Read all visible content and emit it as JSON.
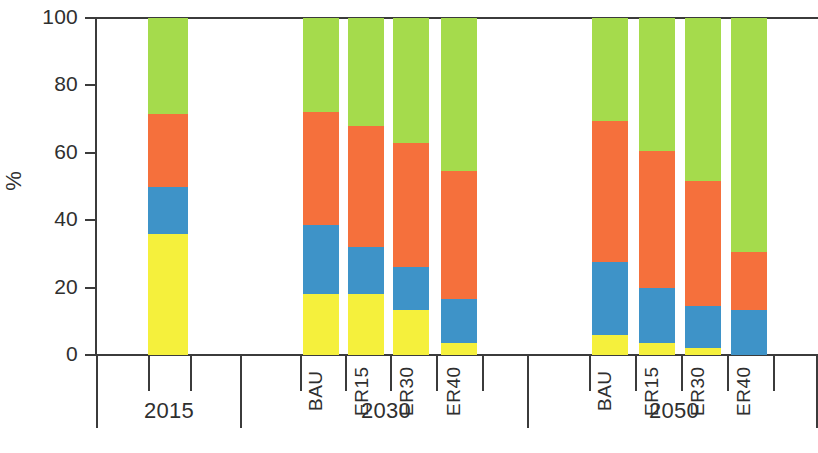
{
  "chart_data": {
    "type": "bar",
    "subtype": "stacked-100-percent",
    "title": "",
    "xlabel": "",
    "ylabel": "%",
    "ylim": [
      0,
      100
    ],
    "yticks": [
      0,
      20,
      40,
      60,
      80,
      100
    ],
    "ytick_labels": [
      "0",
      "20",
      "40",
      "60",
      "80",
      "100"
    ],
    "grid": false,
    "legend": "none",
    "colors": {
      "yellow": "#F5F03C",
      "blue": "#3E93C8",
      "orange": "#F5703C",
      "green": "#A5DB4C"
    },
    "series": [
      {
        "name": "yellow",
        "color": "#F5F03C",
        "values": [
          36,
          18,
          18,
          13.5,
          3.5,
          6,
          3.5,
          2,
          0
        ]
      },
      {
        "name": "blue",
        "color": "#3E93C8",
        "values": [
          14,
          20.5,
          14,
          12.5,
          13,
          21.5,
          16.5,
          12.5,
          13.5
        ]
      },
      {
        "name": "orange",
        "color": "#F5703C",
        "values": [
          21.5,
          33.5,
          36,
          37,
          38,
          42,
          40.5,
          37,
          17
        ]
      },
      {
        "name": "green",
        "color": "#A5DB4C",
        "values": [
          28.5,
          28,
          32,
          37,
          45.5,
          30.5,
          39.5,
          48.5,
          69.5
        ]
      }
    ],
    "categories": [
      "2015",
      "BAU",
      "ER15",
      "ER30",
      "ER40",
      "BAU",
      "ER15",
      "ER30",
      "ER40"
    ],
    "groups": [
      {
        "label": "2015",
        "scenarios": [
          "2015"
        ]
      },
      {
        "label": "2030",
        "scenarios": [
          "BAU",
          "ER15",
          "ER30",
          "ER40"
        ]
      },
      {
        "label": "2050",
        "scenarios": [
          "BAU",
          "ER15",
          "ER30",
          "ER40"
        ]
      }
    ]
  },
  "axis": {
    "y_title": "%",
    "y_ticks": [
      {
        "label": "100",
        "value": 100
      },
      {
        "label": "80",
        "value": 80
      },
      {
        "label": "60",
        "value": 60
      },
      {
        "label": "40",
        "value": 40
      },
      {
        "label": "20",
        "value": 20
      },
      {
        "label": "0",
        "value": 0
      }
    ]
  },
  "bars": [
    {
      "id": "bar-2015",
      "group": "2015",
      "scenario": "2015",
      "x": 148,
      "width": 40,
      "yellow": 36,
      "blue": 14,
      "orange": 21.5,
      "green": 28.5,
      "show_scenario_label": false
    },
    {
      "id": "bar-2030-bau",
      "group": "2030",
      "scenario": "BAU",
      "x": 303,
      "width": 36,
      "yellow": 18,
      "blue": 20.5,
      "orange": 33.5,
      "green": 28,
      "show_scenario_label": true
    },
    {
      "id": "bar-2030-er15",
      "group": "2030",
      "scenario": "ER15",
      "x": 348,
      "width": 36,
      "yellow": 18,
      "blue": 14,
      "orange": 36,
      "green": 32,
      "show_scenario_label": true
    },
    {
      "id": "bar-2030-er30",
      "group": "2030",
      "scenario": "ER30",
      "x": 393,
      "width": 36,
      "yellow": 13.5,
      "blue": 12.5,
      "orange": 37,
      "green": 37,
      "show_scenario_label": true
    },
    {
      "id": "bar-2030-er40",
      "group": "2030",
      "scenario": "ER40",
      "x": 441,
      "width": 36,
      "yellow": 3.5,
      "blue": 13,
      "orange": 38,
      "green": 45.5,
      "show_scenario_label": true
    },
    {
      "id": "bar-2050-bau",
      "group": "2050",
      "scenario": "BAU",
      "x": 592,
      "width": 36,
      "yellow": 6,
      "blue": 21.5,
      "orange": 42,
      "green": 30.5,
      "show_scenario_label": true
    },
    {
      "id": "bar-2050-er15",
      "group": "2050",
      "scenario": "ER15",
      "x": 639,
      "width": 36,
      "yellow": 3.5,
      "blue": 16.5,
      "orange": 40.5,
      "green": 39.5,
      "show_scenario_label": true
    },
    {
      "id": "bar-2050-er30",
      "group": "2050",
      "scenario": "ER30",
      "x": 685,
      "width": 36,
      "yellow": 2,
      "blue": 12.5,
      "orange": 37,
      "green": 48.5,
      "show_scenario_label": true
    },
    {
      "id": "bar-2050-er40",
      "group": "2050",
      "scenario": "ER40",
      "x": 731,
      "width": 36,
      "yellow": 0,
      "blue": 13.5,
      "orange": 17,
      "green": 69.5,
      "show_scenario_label": true
    }
  ],
  "scenario_labels": [
    {
      "text": "BAU",
      "x": 305
    },
    {
      "text": "ER15",
      "x": 351
    },
    {
      "text": "ER30",
      "x": 396
    },
    {
      "text": "ER40",
      "x": 443
    },
    {
      "text": "BAU",
      "x": 594
    },
    {
      "text": "ER15",
      "x": 641
    },
    {
      "text": "ER30",
      "x": 687
    },
    {
      "text": "ER40",
      "x": 733
    }
  ],
  "group_labels": [
    {
      "text": "2015",
      "x": 113,
      "width": 112
    },
    {
      "text": "2030",
      "x": 330,
      "width": 112
    },
    {
      "text": "2050",
      "x": 618,
      "width": 112
    }
  ],
  "x_ticks_minor": [
    148,
    190,
    300,
    345,
    390,
    436,
    482,
    589,
    635,
    681,
    727,
    773
  ],
  "x_ticks_major": [
    96,
    240,
    527,
    816
  ]
}
